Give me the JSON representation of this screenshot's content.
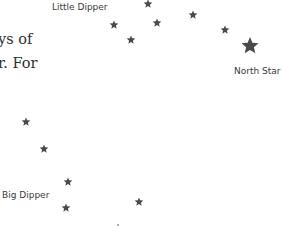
{
  "body_text": {
    "line1": "ys of",
    "line2": "r. For"
  },
  "labels": {
    "little_dipper": "Little Dipper",
    "north_star": "North Star",
    "big_dipper": "Big Dipper"
  },
  "colors": {
    "star": "#4a4a4a",
    "label": "#3a3a3a",
    "text": "#2f2f2f",
    "background": "#ffffff"
  },
  "stars": {
    "little_dipper": [
      {
        "x": 148,
        "y": 4,
        "r": 4.5
      },
      {
        "x": 114,
        "y": 25,
        "r": 4.5
      },
      {
        "x": 157,
        "y": 23,
        "r": 4.5
      },
      {
        "x": 131,
        "y": 40,
        "r": 4.5
      },
      {
        "x": 193,
        "y": 15,
        "r": 4.5
      },
      {
        "x": 225,
        "y": 30,
        "r": 4.5
      }
    ],
    "north_star": {
      "x": 250,
      "y": 46,
      "r": 9
    },
    "big_dipper": [
      {
        "x": 26,
        "y": 122,
        "r": 4.5
      },
      {
        "x": 44,
        "y": 149,
        "r": 4.5
      },
      {
        "x": 68,
        "y": 182,
        "r": 4.5
      },
      {
        "x": 66,
        "y": 208,
        "r": 4.5
      },
      {
        "x": 139,
        "y": 202,
        "r": 4.5
      }
    ]
  }
}
